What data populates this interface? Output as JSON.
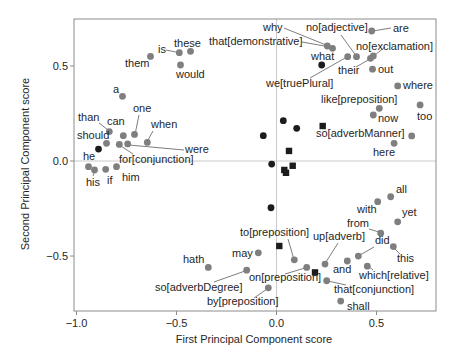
{
  "chart_data": {
    "type": "scatter",
    "title": "",
    "xlabel": "First Principal Component score",
    "ylabel": "Second Principal Component score",
    "xlim": [
      -1.0125,
      0.7975
    ],
    "ylim": [
      -0.789,
      0.747
    ],
    "xticks": [
      {
        "value": -1.0,
        "label": "−1.0"
      },
      {
        "value": -0.5,
        "label": "−0.5"
      },
      {
        "value": 0.0,
        "label": "0.0"
      },
      {
        "value": 0.5,
        "label": "0.5"
      }
    ],
    "yticks": [
      {
        "value": -0.5,
        "label": "−0.5"
      },
      {
        "value": 0.0,
        "label": "0.0"
      },
      {
        "value": 0.5,
        "label": "0.5"
      }
    ],
    "grid": "reference lines at x=0 and y=0 only",
    "legend": null,
    "series": [
      {
        "name": "gray circles",
        "marker": "circle",
        "color": "#7f7f7f",
        "points": [
          {
            "label": "them",
            "x": -0.63,
            "y": 0.55,
            "label_px": [
              125,
              67
            ]
          },
          {
            "label": "is",
            "x": -0.486,
            "y": 0.57,
            "label_px": [
              158,
              53
            ],
            "leader": [
              166,
              50,
              178,
              52.5
            ]
          },
          {
            "label": "these",
            "x": -0.43,
            "y": 0.577,
            "label_px": [
              174,
              47
            ]
          },
          {
            "label": "would",
            "x": -0.48,
            "y": 0.505,
            "label_px": [
              176,
              78
            ]
          },
          {
            "label": "a",
            "x": -0.77,
            "y": 0.34,
            "label_px": [
              113,
              93
            ]
          },
          {
            "label": "than",
            "x": -0.836,
            "y": 0.155,
            "label_px": [
              78,
              121
            ],
            "leader": [
              99,
              123,
              108,
              130
            ]
          },
          {
            "label": "can",
            "x": -0.766,
            "y": 0.133,
            "label_px": [
              107,
              125
            ]
          },
          {
            "label": "one",
            "x": -0.71,
            "y": 0.14,
            "label_px": [
              133,
              112
            ],
            "leader": [
              139,
              115,
              135.5,
              132
            ]
          },
          {
            "label": "when",
            "x": -0.646,
            "y": 0.098,
            "label_px": [
              151,
              128
            ],
            "leader": [
              153,
              131,
              148,
              140
            ]
          },
          {
            "label": "should",
            "x": -0.85,
            "y": 0.093,
            "label_px": [
              77,
              139
            ]
          },
          {
            "label": "for[conjunction]",
            "x": -0.786,
            "y": 0.087,
            "label_px": [
              119,
              163
            ],
            "leader": [
              133,
              154,
              121,
              146
            ]
          },
          {
            "label": "were",
            "x": -0.744,
            "y": 0.09,
            "label_px": [
              185,
              153
            ],
            "leader": [
              129,
              145,
              184,
              150
            ]
          },
          {
            "label": "he",
            "x": -0.94,
            "y": -0.03,
            "label_px": [
              83,
              160
            ]
          },
          {
            "label": "his",
            "x": -0.91,
            "y": -0.047,
            "label_px": [
              86,
              186
            ],
            "leader": [
              93,
              176,
              94.5,
              172
            ]
          },
          {
            "label": "if",
            "x": -0.854,
            "y": -0.044,
            "label_px": [
              107,
              184
            ]
          },
          {
            "label": "him",
            "x": -0.8,
            "y": -0.03,
            "label_px": [
              122,
              181
            ]
          },
          {
            "label": "why",
            "x": 0.254,
            "y": 0.605,
            "label_px": [
              263,
              31
            ],
            "leader": [
              284,
              28,
              326,
              45
            ]
          },
          {
            "label": "that[demonstrative]",
            "x": 0.28,
            "y": 0.593,
            "label_px": [
              209,
              45
            ],
            "leader": [
              302,
              42,
              330,
              47
            ]
          },
          {
            "label": "we[truePlural]",
            "x": 0.356,
            "y": 0.549,
            "label_px": [
              266,
              87
            ],
            "leader": [
              310,
              78,
              346,
              57.5
            ]
          },
          {
            "label": "no[adjective]",
            "x": 0.4,
            "y": 0.549,
            "label_px": [
              306,
              31
            ],
            "leader": [
              341,
              35,
              355.5,
              55
            ]
          },
          {
            "label": "are",
            "x": 0.476,
            "y": 0.684,
            "label_px": [
              393,
              32
            ],
            "leader": [
              373,
              31,
              391,
              28
            ]
          },
          {
            "label": "their",
            "x": 0.47,
            "y": 0.54,
            "label_px": [
              338,
              74
            ],
            "leader": [
              356,
              67,
              369,
              59.5
            ]
          },
          {
            "label": "no[exclamation]",
            "x": 0.484,
            "y": 0.553,
            "label_px": [
              356,
              50
            ],
            "leader": [
              375,
              55,
              385,
              47
            ]
          },
          {
            "label": "out",
            "x": 0.48,
            "y": 0.483,
            "label_px": [
              378,
              73
            ]
          },
          {
            "label": "where",
            "x": 0.606,
            "y": 0.395,
            "label_px": [
              403,
              89
            ]
          },
          {
            "label": "like[preposition]",
            "x": 0.514,
            "y": 0.277,
            "label_px": [
              321,
              103
            ]
          },
          {
            "label": "now",
            "x": 0.484,
            "y": 0.242,
            "label_px": [
              378,
              122
            ]
          },
          {
            "label": "too",
            "x": 0.718,
            "y": 0.295,
            "label_px": [
              417,
              120
            ]
          },
          {
            "label": "so[adverbManner]",
            "x": 0.676,
            "y": 0.132,
            "label_px": [
              316,
              137
            ]
          },
          {
            "label": "here",
            "x": 0.588,
            "y": 0.093,
            "label_px": [
              373,
              156
            ]
          },
          {
            "label": "all",
            "x": 0.571,
            "y": -0.188,
            "label_px": [
              396,
              193
            ]
          },
          {
            "label": "with",
            "x": 0.506,
            "y": -0.214,
            "label_px": [
              357,
              213
            ]
          },
          {
            "label": "yet",
            "x": 0.606,
            "y": -0.32,
            "label_px": [
              402,
              216
            ]
          },
          {
            "label": "from",
            "x": 0.521,
            "y": -0.38,
            "label_px": [
              347,
              227
            ],
            "leader": [
              369,
              229,
              379,
              232
            ]
          },
          {
            "label": "this",
            "x": 0.584,
            "y": -0.45,
            "label_px": [
              397,
              262
            ],
            "leader": [
              394,
              248,
              400,
              254
            ]
          },
          {
            "label": "did",
            "x": 0.409,
            "y": -0.5,
            "label_px": [
              375,
              244
            ],
            "leader": [
              374,
              247,
              360,
              255
            ]
          },
          {
            "label": "and",
            "x": 0.354,
            "y": -0.526,
            "label_px": [
              333,
              273
            ]
          },
          {
            "label": "which[relative]",
            "x": 0.454,
            "y": -0.553,
            "label_px": [
              359,
              279
            ],
            "leader": [
              368,
              266,
              373,
              270
            ]
          },
          {
            "label": "up[adverb]",
            "x": 0.2425,
            "y": -0.542,
            "label_px": [
              313,
              240
            ],
            "leader": [
              338,
              243,
              326,
              262
            ]
          },
          {
            "label": "on[preposition]",
            "x": 0.151,
            "y": -0.56,
            "label_px": [
              249,
              281
            ],
            "leader": [
              285,
              274,
              305,
              268
            ]
          },
          {
            "label": "to[preposition]",
            "x": 0.089,
            "y": -0.52,
            "label_px": [
              240,
              236
            ],
            "leader": [
              288,
              239,
              293.5,
              258
            ]
          },
          {
            "label": "that[conjunction]",
            "x": 0.251,
            "y": -0.63,
            "label_px": [
              334,
              293
            ],
            "leader": [
              328,
              281,
              346,
              285
            ]
          },
          {
            "label": "shall",
            "x": 0.321,
            "y": -0.737,
            "label_px": [
              347,
              310
            ]
          },
          {
            "label": "may",
            "x": -0.091,
            "y": -0.483,
            "label_px": [
              232,
              257
            ]
          },
          {
            "label": "hath",
            "x": -0.341,
            "y": -0.56,
            "label_px": [
              183,
              263
            ]
          },
          {
            "label": "so[adverbDegree]",
            "x": -0.149,
            "y": -0.574,
            "label_px": [
              155,
              291
            ],
            "leader": [
              214,
              282,
              245,
              271
            ]
          },
          {
            "label": "by[preposition]",
            "x": -0.041,
            "y": -0.667,
            "label_px": [
              207,
              305
            ],
            "leader": [
              254,
              298,
              267,
              289
            ]
          }
        ]
      },
      {
        "name": "black circles",
        "marker": "circle",
        "color": "#1c1c1c",
        "points": [
          {
            "label": "what",
            "x": 0.226,
            "y": 0.505,
            "label_px": [
              311,
              60
            ]
          },
          {
            "x": -0.89,
            "y": 0.063
          },
          {
            "x": 0.034,
            "y": 0.212
          },
          {
            "x": 0.101,
            "y": 0.172
          },
          {
            "x": -0.066,
            "y": 0.133
          },
          {
            "x": -0.024,
            "y": -0.016
          },
          {
            "x": -0.0275,
            "y": -0.246
          }
        ]
      },
      {
        "name": "black squares",
        "marker": "square",
        "color": "#1c1c1c",
        "points": [
          {
            "x": 0.231,
            "y": 0.184
          },
          {
            "x": 0.0625,
            "y": 0.053
          },
          {
            "x": 0.081,
            "y": -0.025
          },
          {
            "x": 0.039,
            "y": -0.047
          },
          {
            "x": 0.0475,
            "y": -0.062
          },
          {
            "x": 0.014,
            "y": -0.447
          },
          {
            "x": 0.1925,
            "y": -0.586
          }
        ]
      }
    ]
  }
}
